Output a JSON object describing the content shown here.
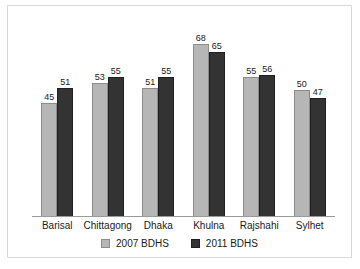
{
  "chart_data": {
    "type": "bar",
    "title": "",
    "subtitle": "",
    "xlabel": "",
    "ylabel": "",
    "ylim": [
      0,
      80
    ],
    "grid": false,
    "legend_position": "bottom",
    "categories": [
      "Barisal",
      "Chittagong",
      "Dhaka",
      "Khulna",
      "Rajshahi",
      "Sylhet"
    ],
    "series": [
      {
        "name": "2007 BDHS",
        "color": "#b6b6b6",
        "values": [
          45,
          53,
          51,
          68,
          55,
          50
        ]
      },
      {
        "name": "2011 BDHS",
        "color": "#333333",
        "values": [
          51,
          55,
          55,
          65,
          56,
          47
        ]
      }
    ],
    "data_labels": true,
    "axis_line_color": "#9a9a9a",
    "frame_color": "#d9d9d9",
    "background": "#ffffff"
  }
}
